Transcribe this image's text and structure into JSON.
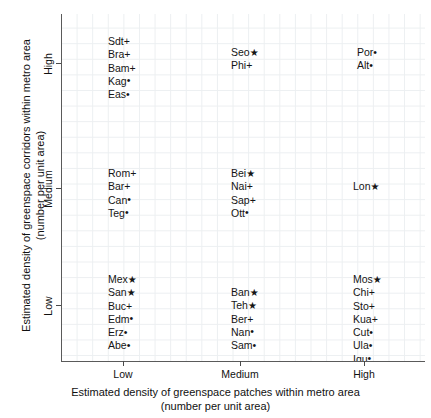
{
  "chart_data": {
    "type": "scatter",
    "title": "",
    "xlabel": "Estimated density of greenspace patches within metro area\n(number per unit area)",
    "ylabel": "Estimated density of greenspace corridors within metro area\n(number per unit area)",
    "xticks": [
      "Low",
      "Medium",
      "High"
    ],
    "yticks": [
      "Low",
      "Medium",
      "High"
    ],
    "xlim": [
      "Low",
      "High"
    ],
    "ylim": [
      "Low",
      "High"
    ],
    "grid": true,
    "legend": "none",
    "marker_types": {
      "star": "★",
      "plus": "+",
      "dot": "•"
    },
    "cells": [
      {
        "id": "low-high",
        "x": "Low",
        "y": "High",
        "points": [
          {
            "label": "Sdt",
            "marker": "plus"
          },
          {
            "label": "Bra",
            "marker": "plus"
          },
          {
            "label": "Bam",
            "marker": "plus"
          },
          {
            "label": "Kag",
            "marker": "dot"
          },
          {
            "label": "Eas",
            "marker": "dot"
          }
        ]
      },
      {
        "id": "medium-high",
        "x": "Medium",
        "y": "High",
        "points": [
          {
            "label": "Seo",
            "marker": "star"
          },
          {
            "label": "Phi",
            "marker": "plus"
          }
        ]
      },
      {
        "id": "high-high",
        "x": "High",
        "y": "High",
        "points": [
          {
            "label": "Por",
            "marker": "dot"
          },
          {
            "label": "Alt",
            "marker": "dot"
          }
        ]
      },
      {
        "id": "low-medium",
        "x": "Low",
        "y": "Medium",
        "points": [
          {
            "label": "Rom",
            "marker": "plus"
          },
          {
            "label": "Bar",
            "marker": "plus"
          },
          {
            "label": "Can",
            "marker": "dot"
          },
          {
            "label": "Teg",
            "marker": "dot"
          }
        ]
      },
      {
        "id": "medium-medium",
        "x": "Medium",
        "y": "Medium",
        "points": [
          {
            "label": "Bei",
            "marker": "star"
          },
          {
            "label": "Nai",
            "marker": "plus"
          },
          {
            "label": "Sap",
            "marker": "plus"
          },
          {
            "label": "Ott",
            "marker": "dot"
          }
        ]
      },
      {
        "id": "high-medium",
        "x": "High",
        "y": "Medium",
        "points": [
          {
            "label": "Lon",
            "marker": "star"
          }
        ]
      },
      {
        "id": "low-low",
        "x": "Low",
        "y": "Low",
        "points": [
          {
            "label": "Mex",
            "marker": "star"
          },
          {
            "label": "San",
            "marker": "star"
          },
          {
            "label": "Buc",
            "marker": "plus"
          },
          {
            "label": "Edm",
            "marker": "dot"
          },
          {
            "label": "Erz",
            "marker": "dot"
          },
          {
            "label": "Abe",
            "marker": "dot"
          }
        ]
      },
      {
        "id": "medium-low",
        "x": "Medium",
        "y": "Low",
        "points": [
          {
            "label": "Ban",
            "marker": "star"
          },
          {
            "label": "Teh",
            "marker": "star"
          },
          {
            "label": "Ber",
            "marker": "plus"
          },
          {
            "label": "Nan",
            "marker": "dot"
          },
          {
            "label": "Sam",
            "marker": "dot"
          }
        ]
      },
      {
        "id": "high-low",
        "x": "High",
        "y": "Low",
        "points": [
          {
            "label": "Mos",
            "marker": "star"
          },
          {
            "label": "Chi",
            "marker": "plus"
          },
          {
            "label": "Sto",
            "marker": "plus"
          },
          {
            "label": "Kua",
            "marker": "plus"
          },
          {
            "label": "Cut",
            "marker": "dot"
          },
          {
            "label": "Ula",
            "marker": "dot"
          },
          {
            "label": "Iqu",
            "marker": "dot"
          },
          {
            "label": "Rah",
            "marker": "dot"
          }
        ]
      }
    ]
  },
  "axes": {
    "x": {
      "title": "Estimated density of greenspace patches within metro area\n(number per unit area)",
      "ticks": [
        {
          "label": "Low",
          "pos": 123
        },
        {
          "label": "Medium",
          "pos": 240
        },
        {
          "label": "High",
          "pos": 364
        }
      ]
    },
    "y": {
      "title": "Estimated density of greenspace corridors within metro area\n(number per unit area)",
      "ticks": [
        {
          "label": "Low",
          "pos": 305
        },
        {
          "label": "Medium",
          "pos": 188
        },
        {
          "label": "High",
          "pos": 63
        }
      ]
    }
  },
  "colors": {
    "grid": "#eceff1",
    "axis": "#5a5a5a",
    "text": "#151515",
    "background": "#ffffff"
  }
}
